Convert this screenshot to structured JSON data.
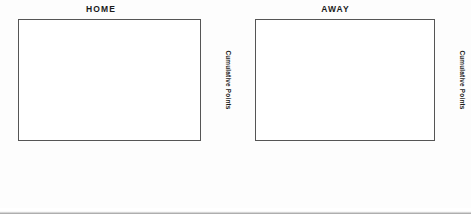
{
  "document": {
    "kind": "scanned-figure-page"
  },
  "charts": [
    {
      "key": "home",
      "title": "HOME",
      "ylabel": "Cumulative Points",
      "yticks": [
        0,
        5,
        10,
        15,
        20,
        25,
        30
      ],
      "ymin": 0,
      "ymax": 30
    },
    {
      "key": "away",
      "title": "AWAY",
      "ylabel": "Cumulative Points",
      "yticks": [
        0,
        5,
        10,
        15,
        20,
        25,
        30
      ],
      "ymin": 0,
      "ymax": 30
    }
  ],
  "chart_data": [
    {
      "type": "bar",
      "title": "HOME",
      "xlabel": "",
      "ylabel": "Cumulative Points",
      "ylim": [
        0,
        30
      ],
      "grid": true,
      "legend": "none",
      "categories": [
        "Blackburn Rovers",
        "Bradford City",
        "Liverpool",
        "Leicester City",
        "Southampton",
        "Chelsea",
        "West Ham United",
        "Everton",
        "Sunderland",
        "Wimbledon",
        "Tottenham Hotspur",
        "Derby County",
        "Aston Villa",
        "Coventry City",
        "Leeds United",
        "Arsenal",
        "Sheffield Wednesday",
        "Manchester United",
        "Newcastle United",
        "Watford"
      ],
      "scores": [
        "0-1",
        "0-1",
        "1-0",
        "0-3",
        "0-2",
        "0-1",
        "2-0",
        "0-1",
        "1-1",
        "0-0",
        "0-1",
        "1-4",
        "0-4",
        "2-0",
        "0-0",
        "2-1",
        "1-0",
        "0-4",
        "0-2",
        "1-1"
      ],
      "values": [
        0,
        2,
        2,
        5,
        5,
        8,
        11,
        12,
        13,
        14,
        16,
        16,
        19,
        20,
        23,
        26,
        26,
        27,
        28,
        29
      ],
      "bar_shades": [
        "light",
        "mid",
        "dark",
        "mid",
        "light",
        "mid",
        "light",
        "light",
        "mid",
        "light",
        "mid",
        "dark",
        "mid",
        "light",
        "mid",
        "mid",
        "dark",
        "dark",
        "light",
        "light"
      ]
    },
    {
      "type": "bar",
      "title": "AWAY",
      "xlabel": "",
      "ylabel": "Cumulative Points",
      "ylim": [
        0,
        30
      ],
      "grid": true,
      "legend": "none",
      "categories": [
        "Wimbledon",
        "Derby County",
        "Aston Villa",
        "Leeds United",
        "Newcastle United",
        "Watford",
        "Arsenal",
        "Bradford City",
        "Sheffield Wednesday",
        "Liverpool",
        "Manchester United",
        "Leicester City",
        "Southampton",
        "Sunderland",
        "Tottenham Hotspur",
        "Coventry City",
        "Chelsea",
        "West Ham United",
        "Everton"
      ],
      "scores": [
        "0-2",
        "2-1",
        "0-1",
        "0-0",
        "1-2",
        "2-1",
        "1-5",
        "1-1",
        "0-1",
        "0-2",
        "0-1",
        "1-5",
        "1-1",
        "1-1",
        "3-4",
        "1-5",
        "1-1",
        "1-0",
        "2-0"
      ],
      "values": [
        2,
        5,
        5,
        5,
        8,
        8,
        9,
        9,
        9,
        10,
        10,
        13,
        14,
        16,
        16,
        17,
        20,
        22,
        23
      ],
      "bar_shades": [
        "light",
        "mid",
        "dark",
        "dark",
        "mid",
        "dark",
        "light",
        "dark",
        "light",
        "dark",
        "light",
        "light",
        "mid",
        "mid",
        "dark",
        "light",
        "mid",
        "mid",
        "mid"
      ]
    }
  ]
}
